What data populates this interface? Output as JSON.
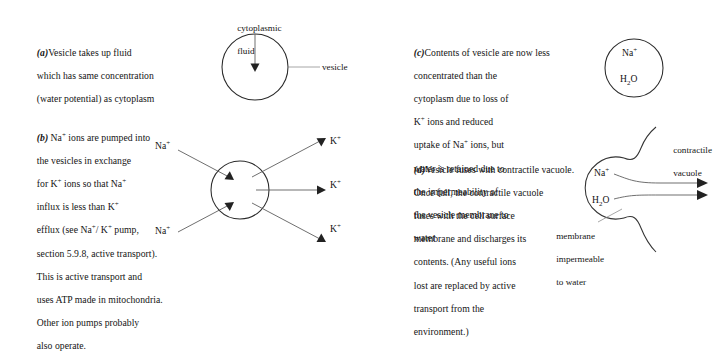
{
  "figure": {
    "panels": [
      {
        "id": "a",
        "tag": "(a)",
        "text_lines": [
          "Vesicle takes up fluid",
          "which has same concentration",
          "(water potential) as cytoplasm"
        ],
        "diagram_labels": {
          "inflow_line1": "cytoplasmic",
          "inflow_line2": "fluid",
          "callout": "vesicle"
        }
      },
      {
        "id": "b",
        "tag": "(b)",
        "text_lines": [
          "Na+ ions are pumped into",
          "the vesicles in exchange",
          "for K+ ions so that Na+",
          "influx is less than K+",
          "efflux (see Na+/ K+ pump,",
          "section 5.9.8, active transport).",
          "This is active transport and",
          "uses ATP made in mitochondria.",
          "Other ion pumps probably",
          "also operate."
        ],
        "diagram_labels": {
          "in_ion": "Na",
          "in_charge": "+",
          "out_ion": "K",
          "out_charge": "+",
          "in_count": 2,
          "out_count": 3
        }
      },
      {
        "id": "c",
        "tag": "(c)",
        "text_lines": [
          "Contents of vesicle are now less",
          "concentrated than the",
          "cytoplasm due to loss of",
          "K+ ions and reduced",
          "uptake of Na+ ions, but",
          "water is retained due to",
          "the impermeability of",
          "the vesicle membrane to",
          "water"
        ],
        "diagram_labels": {
          "ion": "Na",
          "ion_charge": "+",
          "water": "H2O"
        }
      },
      {
        "id": "d",
        "tag": "(d)",
        "text_lines": [
          "Vesicle fuses with contractile vacuole.",
          "Once full, the contractile vacuole",
          "fuses with the cell surface",
          "membrane and discharges its",
          "contents. (Any useful ions",
          "lost are replaced by active",
          "transport from the",
          "environment.)"
        ],
        "diagram_labels": {
          "vacuole_line1": "contractile",
          "vacuole_line2": "vacuole",
          "ion": "Na",
          "ion_charge": "+",
          "water": "H2O",
          "membrane_line1": "membrane",
          "membrane_line2": "impermeable",
          "membrane_line3": "to water"
        }
      }
    ]
  },
  "colors": {
    "ink": "#141414",
    "stroke": "#333333",
    "leader": "#8a8a8a",
    "background": "#ffffff"
  }
}
